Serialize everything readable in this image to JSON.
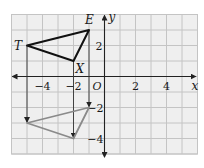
{
  "diagram": {
    "type": "coordinate-plane-translation",
    "grid": {
      "x_min": -6,
      "x_max": 6,
      "y_min": -5,
      "y_max": 4,
      "background": "#efefef",
      "line_color": "#c4c4c4"
    },
    "axes": {
      "x_label": "x",
      "y_label": "y",
      "origin_label": "O",
      "x_ticks": [
        {
          "value": -4,
          "label": "−4"
        },
        {
          "value": -2,
          "label": "−2"
        },
        {
          "value": 2,
          "label": "2"
        },
        {
          "value": 4,
          "label": "4"
        }
      ],
      "y_ticks": [
        {
          "value": 2,
          "label": "2"
        },
        {
          "value": -2,
          "label": "−2"
        },
        {
          "value": -4,
          "label": "−4"
        }
      ]
    },
    "original_triangle": {
      "color": "#111111",
      "vertices": [
        {
          "name": "T",
          "x": -5,
          "y": 2
        },
        {
          "name": "E",
          "x": -1,
          "y": 3
        },
        {
          "name": "X",
          "x": -2,
          "y": 1
        }
      ]
    },
    "image_triangle": {
      "color": "#8a8a8a",
      "vertices": [
        {
          "x": -5,
          "y": -3
        },
        {
          "x": -1,
          "y": -2
        },
        {
          "x": -2,
          "y": -4
        }
      ]
    },
    "translation_arrows": [
      {
        "from": "T",
        "x": -5,
        "y1": 2,
        "y2": -3
      },
      {
        "from": "E",
        "x": -1,
        "y1": 3,
        "y2": -2
      },
      {
        "from": "X",
        "x": -2,
        "y1": 1,
        "y2": -4
      }
    ]
  }
}
